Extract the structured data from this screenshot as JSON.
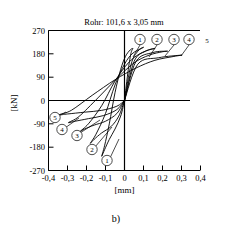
{
  "chart_data": {
    "type": "line",
    "title": "Rohr: 101,6 x 3,05 mm",
    "xlabel": "[mm]",
    "ylabel": "[kN]",
    "xlim": [
      -0.4,
      0.4
    ],
    "ylim": [
      -270,
      270
    ],
    "grid": false,
    "legend_position": "inline-annotations",
    "xticks": [
      "-0,4",
      "-0,3",
      "-0,2",
      "-0,1",
      "0",
      "0,1",
      "0,2",
      "0,3",
      "0,4"
    ],
    "xtick_values": [
      -0.4,
      -0.3,
      -0.2,
      -0.1,
      0,
      0.1,
      0.2,
      0.3,
      0.4
    ],
    "yticks": [
      "270",
      "180",
      "90",
      "0",
      "-90",
      "-180",
      "-270"
    ],
    "ytick_values": [
      270,
      180,
      90,
      0,
      -90,
      -180,
      -270
    ],
    "series": [
      {
        "name": "1",
        "peak_positive": [
          0.04,
          200
        ],
        "peak_negative": [
          -0.12,
          -215
        ],
        "points": [
          [
            0.0,
            0
          ],
          [
            0.02,
            120
          ],
          [
            0.035,
            185
          ],
          [
            0.045,
            200
          ],
          [
            0.03,
            195
          ],
          [
            0.005,
            170
          ],
          [
            -0.02,
            120
          ],
          [
            -0.05,
            30
          ],
          [
            -0.08,
            -90
          ],
          [
            -0.105,
            -175
          ],
          [
            -0.12,
            -215
          ],
          [
            -0.105,
            -190
          ],
          [
            -0.08,
            -150
          ],
          [
            -0.05,
            -110
          ],
          [
            -0.02,
            -60
          ],
          [
            0.0,
            0
          ]
        ]
      },
      {
        "name": "2",
        "peak_positive": [
          0.1,
          205
        ],
        "peak_negative": [
          -0.18,
          -165
        ],
        "points": [
          [
            0.0,
            0
          ],
          [
            0.035,
            140
          ],
          [
            0.07,
            190
          ],
          [
            0.1,
            205
          ],
          [
            0.085,
            200
          ],
          [
            0.04,
            180
          ],
          [
            0.0,
            140
          ],
          [
            -0.05,
            60
          ],
          [
            -0.1,
            -50
          ],
          [
            -0.15,
            -130
          ],
          [
            -0.18,
            -165
          ],
          [
            -0.16,
            -150
          ],
          [
            -0.12,
            -125
          ],
          [
            -0.07,
            -100
          ],
          [
            -0.03,
            -60
          ],
          [
            0.0,
            0
          ]
        ]
      },
      {
        "name": "3",
        "peak_positive": [
          0.16,
          200
        ],
        "peak_negative": [
          -0.235,
          -120
        ],
        "points": [
          [
            0.0,
            0
          ],
          [
            0.05,
            150
          ],
          [
            0.11,
            190
          ],
          [
            0.16,
            200
          ],
          [
            0.14,
            198
          ],
          [
            0.08,
            180
          ],
          [
            0.02,
            145
          ],
          [
            -0.05,
            75
          ],
          [
            -0.12,
            -20
          ],
          [
            -0.19,
            -90
          ],
          [
            -0.235,
            -120
          ],
          [
            -0.21,
            -110
          ],
          [
            -0.16,
            -95
          ],
          [
            -0.1,
            -80
          ],
          [
            -0.04,
            -50
          ],
          [
            0.0,
            0
          ]
        ]
      },
      {
        "name": "4",
        "peak_positive": [
          0.225,
          190
        ],
        "peak_negative": [
          -0.295,
          -85
        ],
        "points": [
          [
            0.0,
            0
          ],
          [
            0.06,
            150
          ],
          [
            0.15,
            185
          ],
          [
            0.225,
            190
          ],
          [
            0.2,
            188
          ],
          [
            0.13,
            175
          ],
          [
            0.05,
            145
          ],
          [
            -0.04,
            85
          ],
          [
            -0.14,
            10
          ],
          [
            -0.24,
            -62
          ],
          [
            -0.295,
            -85
          ],
          [
            -0.26,
            -80
          ],
          [
            -0.19,
            -70
          ],
          [
            -0.11,
            -58
          ],
          [
            -0.04,
            -35
          ],
          [
            0.0,
            0
          ]
        ]
      },
      {
        "name": "5",
        "peak_positive": [
          0.3,
          175
        ],
        "peak_negative": [
          -0.345,
          -55
        ],
        "points": [
          [
            0.0,
            0
          ],
          [
            0.07,
            140
          ],
          [
            0.18,
            165
          ],
          [
            0.3,
            175
          ],
          [
            0.26,
            170
          ],
          [
            0.16,
            155
          ],
          [
            0.06,
            125
          ],
          [
            -0.05,
            80
          ],
          [
            -0.17,
            20
          ],
          [
            -0.28,
            -38
          ],
          [
            -0.345,
            -55
          ],
          [
            -0.3,
            -52
          ],
          [
            -0.21,
            -45
          ],
          [
            -0.12,
            -38
          ],
          [
            -0.04,
            -22
          ],
          [
            0.0,
            0
          ]
        ]
      }
    ],
    "annotations_top": [
      {
        "label": "1",
        "circled": true
      },
      {
        "label": "2",
        "circled": true
      },
      {
        "label": "3",
        "circled": true
      },
      {
        "label": "4",
        "circled": true
      },
      {
        "label": "5",
        "circled": false
      }
    ],
    "annotations_bottom": [
      {
        "label": "5",
        "circled": true
      },
      {
        "label": "4",
        "circled": true
      },
      {
        "label": "3",
        "circled": true
      },
      {
        "label": "2",
        "circled": true
      },
      {
        "label": "1",
        "circled": true
      }
    ]
  },
  "figure": {
    "caption": "b)"
  }
}
